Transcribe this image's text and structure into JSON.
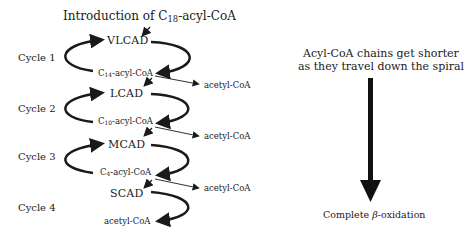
{
  "title": {
    "prefix": "Introduction of C",
    "sub": "18",
    "suffix": "-acyl-CoA"
  },
  "cycles": [
    {
      "label": "Cycle 1",
      "enzyme": "VLCAD",
      "product_prefix": "C",
      "product_sub": "14",
      "product_suffix": "-acyl-CoA",
      "byproduct": "acetyl-CoA"
    },
    {
      "label": "Cycle 2",
      "enzyme": "LCAD",
      "product_prefix": "C",
      "product_sub": "10",
      "product_suffix": "-acyl-CoA",
      "byproduct": "acetyl-CoA"
    },
    {
      "label": "Cycle 3",
      "enzyme": "MCAD",
      "product_prefix": "C",
      "product_sub": "4",
      "product_suffix": "-acyl-CoA",
      "byproduct": "acetyl-CoA"
    },
    {
      "label": "Cycle 4",
      "enzyme": "SCAD",
      "product": "acetyl-CoA"
    }
  ],
  "side_note": {
    "line1": "Acyl-CoA chains get shorter",
    "line2": "as they travel down the spiral",
    "result_prefix": "Complete ",
    "result_beta": "β",
    "result_suffix": "-oxidation"
  },
  "colors": {
    "ink": "#1a1a1a",
    "background": "#ffffff"
  }
}
